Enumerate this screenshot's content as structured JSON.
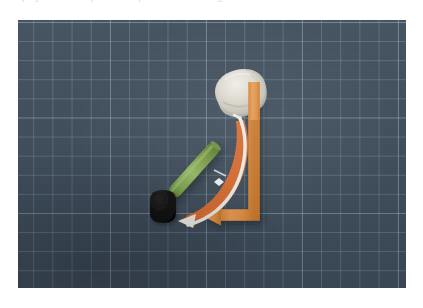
{
  "caption": {
    "text": "the physical setup for the pendulum swing demonstration",
    "visible": "partially cut off at top edge"
  },
  "photo": {
    "title": "overhead photograph of pendulum setup on a cutting mat",
    "background": {
      "name": "cutting-mat",
      "base_color": "#3f4d5c",
      "grid_color": "#aac8d7",
      "grid_cell_px": 19,
      "description": "dark slate-blue self-healing cutting mat with light blue grid"
    },
    "objects": [
      {
        "id": "white-ball",
        "name": "crumpled-white-ball",
        "label": "white crumpled ball",
        "color": "#e9e5dc",
        "shadow_color": "#2f3a46",
        "position": {
          "x": 235,
          "y": 88
        },
        "size": {
          "w": 46,
          "h": 42
        }
      },
      {
        "id": "green-rod",
        "name": "green-rod",
        "label": "green cylindrical rod",
        "color": "#7fa64a",
        "highlight_color": "#9dc163",
        "shadow_color": "#5a7a32",
        "start": {
          "x": 166,
          "y": 192
        },
        "end": {
          "x": 218,
          "y": 133
        },
        "thickness_px": 13
      },
      {
        "id": "black-cap",
        "name": "black-cap",
        "label": "black rounded cap",
        "color": "#0d0d0e",
        "position": {
          "x": 150,
          "y": 196
        },
        "size": {
          "w": 26,
          "h": 30
        }
      }
    ],
    "annotations": [
      {
        "id": "orange-l-arrow",
        "name": "orange-angle-arrow",
        "label": "orange L-shaped arrow",
        "color": "#e8933f",
        "stroke_width_px": 11,
        "vertical_from": {
          "x": 253,
          "y": 97
        },
        "corner": {
          "x": 253,
          "y": 212
        },
        "horizontal_to": {
          "x": 210,
          "y": 212
        },
        "arrowhead": "left"
      },
      {
        "id": "white-curve-arrow",
        "name": "white-curved-arrow",
        "label": "white curved swing arrow",
        "color": "#f6f4ef",
        "start": {
          "x": 240,
          "y": 119
        },
        "end": {
          "x": 182,
          "y": 214
        },
        "node": {
          "x": 219,
          "y": 179
        },
        "arrowhead": "lower-left"
      },
      {
        "id": "orange-curve-arrow",
        "name": "orange-curved-arrow",
        "label": "orange curved swing arrow",
        "color": "#e8702e",
        "start": {
          "x": 243,
          "y": 118
        },
        "end": {
          "x": 185,
          "y": 217
        },
        "arrowhead": "lower-left"
      }
    ],
    "legend_note": "no visible legend or axis labels"
  }
}
